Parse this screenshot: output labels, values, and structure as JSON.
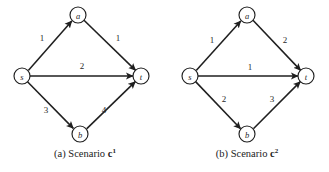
{
  "figure": {
    "panels": [
      {
        "id": "panel-a",
        "caption_prefix": "(a) Scenario",
        "caption_symbol": "c",
        "caption_superscript": "1",
        "nodes": [
          {
            "id": "s",
            "label": "s",
            "cx": 22,
            "cy": 76,
            "r": 8
          },
          {
            "id": "a",
            "label": "a",
            "cx": 78,
            "cy": 15,
            "r": 8
          },
          {
            "id": "t",
            "label": "t",
            "cx": 141,
            "cy": 76,
            "r": 8
          },
          {
            "id": "b",
            "label": "b",
            "cx": 80,
            "cy": 134,
            "r": 8
          }
        ],
        "edges": [
          {
            "id": "s-a",
            "from": "s",
            "to": "a",
            "label": "1",
            "lx": 42,
            "ly": 38
          },
          {
            "id": "a-t",
            "from": "a",
            "to": "t",
            "label": "1",
            "lx": 118,
            "ly": 38
          },
          {
            "id": "s-t",
            "from": "s",
            "to": "t",
            "label": "2",
            "lx": 82,
            "ly": 66
          },
          {
            "id": "s-b",
            "from": "s",
            "to": "b",
            "label": "3",
            "lx": 46,
            "ly": 110
          },
          {
            "id": "b-t",
            "from": "b",
            "to": "t",
            "label": "4",
            "lx": 104,
            "ly": 110
          }
        ]
      },
      {
        "id": "panel-b",
        "caption_prefix": "(b) Scenario",
        "caption_symbol": "c",
        "caption_superscript": "2",
        "nodes": [
          {
            "id": "s",
            "label": "s",
            "cx": 25,
            "cy": 76,
            "r": 8
          },
          {
            "id": "a",
            "label": "a",
            "cx": 82,
            "cy": 15,
            "r": 8
          },
          {
            "id": "t",
            "label": "t",
            "cx": 141,
            "cy": 76,
            "r": 8
          },
          {
            "id": "b",
            "label": "b",
            "cx": 82,
            "cy": 134,
            "r": 8
          }
        ],
        "edges": [
          {
            "id": "s-a",
            "from": "s",
            "to": "a",
            "label": "1",
            "lx": 47,
            "ly": 40
          },
          {
            "id": "a-t",
            "from": "a",
            "to": "t",
            "label": "2",
            "lx": 120,
            "ly": 40
          },
          {
            "id": "s-t",
            "from": "s",
            "to": "t",
            "label": "1",
            "lx": 85,
            "ly": 67
          },
          {
            "id": "s-b",
            "from": "s",
            "to": "b",
            "label": "2",
            "lx": 59,
            "ly": 99
          },
          {
            "id": "b-t",
            "from": "b",
            "to": "t",
            "label": "3",
            "lx": 107,
            "ly": 99
          }
        ]
      }
    ],
    "colors": {
      "background": "#ffffff",
      "stroke": "#1f1f1f",
      "node_fill": "#ffffff",
      "text": "#222222"
    }
  }
}
